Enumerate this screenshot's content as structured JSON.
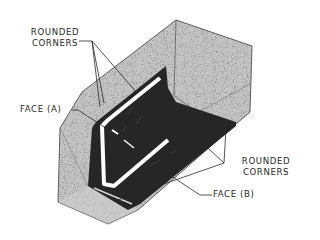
{
  "diagram": {
    "colors": {
      "block_fill": "#bdbdbd",
      "block_speckle": "#6e6e6e",
      "face_fill": "#262626",
      "highlight": "#ffffff",
      "line": "#2a2a2a",
      "background": "#ffffff"
    },
    "labels": {
      "rounded_corners_top_line1": "ROUNDED",
      "rounded_corners_top_line2": "CORNERS",
      "face_a": "FACE (A)",
      "rounded_corners_right_line1": "ROUNDED",
      "rounded_corners_right_line2": "CORNERS",
      "face_b": "FACE (B)"
    }
  }
}
